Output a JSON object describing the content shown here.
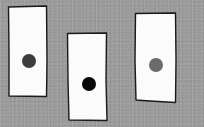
{
  "scene": {
    "description": "Three hand-drawn white rectangular strips on a gray textured background, each with a single dot",
    "background_color": "#9b9b9b",
    "cards": [
      {
        "name": "left-card",
        "x": 8,
        "y": 6,
        "w": 39,
        "h": 91,
        "fill": "#fbfbfb",
        "stroke": "#1a1a1a",
        "dot": {
          "cx": 29,
          "cy": 61,
          "r": 7,
          "color": "#3c3c3c",
          "shade": "dark gray"
        }
      },
      {
        "name": "middle-card",
        "x": 67,
        "y": 33,
        "w": 40,
        "h": 88,
        "fill": "#fbfbfb",
        "stroke": "#1a1a1a",
        "dot": {
          "cx": 89,
          "cy": 84,
          "r": 7,
          "color": "#080808",
          "shade": "black"
        }
      },
      {
        "name": "right-card",
        "x": 135,
        "y": 13,
        "w": 41,
        "h": 90,
        "fill": "#fbfbfb",
        "stroke": "#1a1a1a",
        "dot": {
          "cx": 156,
          "cy": 65,
          "r": 7,
          "color": "#6b6b6b",
          "shade": "medium gray"
        }
      }
    ]
  }
}
